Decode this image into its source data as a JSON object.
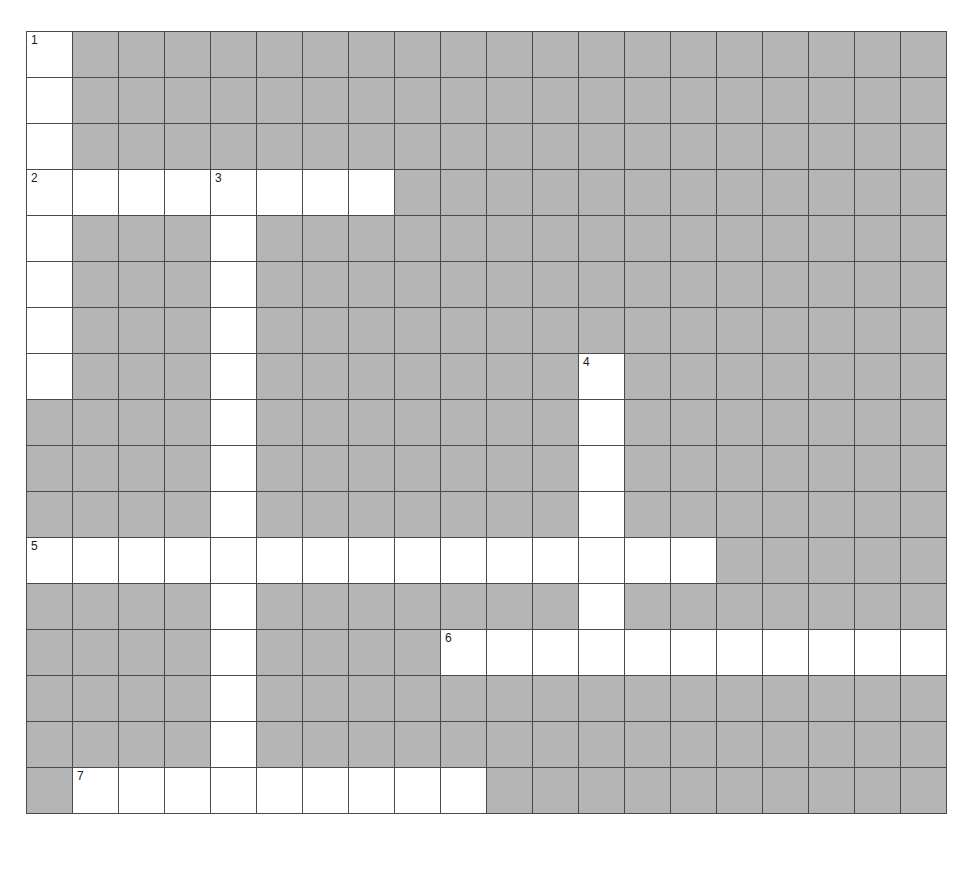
{
  "puzzle": {
    "title": "",
    "rows": 17,
    "cols": 20,
    "cell_size": 46,
    "colors": {
      "open_cell": "#ffffff",
      "block_cell": "#b5b5b5",
      "grid_line": "#4a4a4a",
      "number_text": "#1b1b1b",
      "page_background": "#ffffff"
    },
    "numbers": [
      {
        "label": "1",
        "row": 0,
        "col": 0
      },
      {
        "label": "2",
        "row": 3,
        "col": 0
      },
      {
        "label": "3",
        "row": 3,
        "col": 4
      },
      {
        "label": "4",
        "row": 7,
        "col": 12
      },
      {
        "label": "5",
        "row": 11,
        "col": 0
      },
      {
        "label": "6",
        "row": 13,
        "col": 9
      },
      {
        "label": "7",
        "row": 16,
        "col": 1
      }
    ],
    "entries": [
      {
        "number": "1",
        "direction": "down",
        "row": 0,
        "col": 0,
        "length": 8
      },
      {
        "number": "2",
        "direction": "across",
        "row": 3,
        "col": 0,
        "length": 8
      },
      {
        "number": "3",
        "direction": "down",
        "row": 3,
        "col": 4,
        "length": 14
      },
      {
        "number": "4",
        "direction": "down",
        "row": 7,
        "col": 12,
        "length": 6
      },
      {
        "number": "5",
        "direction": "across",
        "row": 11,
        "col": 0,
        "length": 15
      },
      {
        "number": "6",
        "direction": "across",
        "row": 13,
        "col": 9,
        "length": 11
      },
      {
        "number": "7",
        "direction": "across",
        "row": 16,
        "col": 1,
        "length": 9
      }
    ],
    "grid": [
      [
        "open",
        "block",
        "block",
        "block",
        "block",
        "block",
        "block",
        "block",
        "block",
        "block",
        "block",
        "block",
        "block",
        "block",
        "block",
        "block",
        "block",
        "block",
        "block",
        "block"
      ],
      [
        "open",
        "block",
        "block",
        "block",
        "block",
        "block",
        "block",
        "block",
        "block",
        "block",
        "block",
        "block",
        "block",
        "block",
        "block",
        "block",
        "block",
        "block",
        "block",
        "block"
      ],
      [
        "open",
        "block",
        "block",
        "block",
        "block",
        "block",
        "block",
        "block",
        "block",
        "block",
        "block",
        "block",
        "block",
        "block",
        "block",
        "block",
        "block",
        "block",
        "block",
        "block"
      ],
      [
        "open",
        "open",
        "open",
        "open",
        "open",
        "open",
        "open",
        "open",
        "block",
        "block",
        "block",
        "block",
        "block",
        "block",
        "block",
        "block",
        "block",
        "block",
        "block",
        "block"
      ],
      [
        "open",
        "block",
        "block",
        "block",
        "open",
        "block",
        "block",
        "block",
        "block",
        "block",
        "block",
        "block",
        "block",
        "block",
        "block",
        "block",
        "block",
        "block",
        "block",
        "block"
      ],
      [
        "open",
        "block",
        "block",
        "block",
        "open",
        "block",
        "block",
        "block",
        "block",
        "block",
        "block",
        "block",
        "block",
        "block",
        "block",
        "block",
        "block",
        "block",
        "block",
        "block"
      ],
      [
        "open",
        "block",
        "block",
        "block",
        "open",
        "block",
        "block",
        "block",
        "block",
        "block",
        "block",
        "block",
        "block",
        "block",
        "block",
        "block",
        "block",
        "block",
        "block",
        "block"
      ],
      [
        "open",
        "block",
        "block",
        "block",
        "open",
        "block",
        "block",
        "block",
        "block",
        "block",
        "block",
        "block",
        "open",
        "block",
        "block",
        "block",
        "block",
        "block",
        "block",
        "block"
      ],
      [
        "block",
        "block",
        "block",
        "block",
        "open",
        "block",
        "block",
        "block",
        "block",
        "block",
        "block",
        "block",
        "open",
        "block",
        "block",
        "block",
        "block",
        "block",
        "block",
        "block"
      ],
      [
        "block",
        "block",
        "block",
        "block",
        "open",
        "block",
        "block",
        "block",
        "block",
        "block",
        "block",
        "block",
        "open",
        "block",
        "block",
        "block",
        "block",
        "block",
        "block",
        "block"
      ],
      [
        "block",
        "block",
        "block",
        "block",
        "open",
        "block",
        "block",
        "block",
        "block",
        "block",
        "block",
        "block",
        "open",
        "block",
        "block",
        "block",
        "block",
        "block",
        "block",
        "block"
      ],
      [
        "open",
        "open",
        "open",
        "open",
        "open",
        "open",
        "open",
        "open",
        "open",
        "open",
        "open",
        "open",
        "open",
        "open",
        "open",
        "block",
        "block",
        "block",
        "block",
        "block"
      ],
      [
        "block",
        "block",
        "block",
        "block",
        "open",
        "block",
        "block",
        "block",
        "block",
        "block",
        "block",
        "block",
        "open",
        "block",
        "block",
        "block",
        "block",
        "block",
        "block",
        "block"
      ],
      [
        "block",
        "block",
        "block",
        "block",
        "open",
        "block",
        "block",
        "block",
        "block",
        "open",
        "open",
        "open",
        "open",
        "open",
        "open",
        "open",
        "open",
        "open",
        "open",
        "open"
      ],
      [
        "block",
        "block",
        "block",
        "block",
        "open",
        "block",
        "block",
        "block",
        "block",
        "block",
        "block",
        "block",
        "block",
        "block",
        "block",
        "block",
        "block",
        "block",
        "block",
        "block"
      ],
      [
        "block",
        "block",
        "block",
        "block",
        "open",
        "block",
        "block",
        "block",
        "block",
        "block",
        "block",
        "block",
        "block",
        "block",
        "block",
        "block",
        "block",
        "block",
        "block",
        "block"
      ],
      [
        "block",
        "open",
        "open",
        "open",
        "open",
        "open",
        "open",
        "open",
        "open",
        "open",
        "block",
        "block",
        "block",
        "block",
        "block",
        "block",
        "block",
        "block",
        "block",
        "block"
      ]
    ]
  }
}
